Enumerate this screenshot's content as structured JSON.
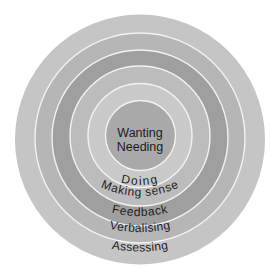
{
  "diagram": {
    "type": "nested-circles",
    "center": {
      "line1": "Wanting",
      "line2": "Needing"
    },
    "rings": [
      {
        "label": "Doing",
        "color": "#c9c9c9"
      },
      {
        "label": "Making sense",
        "color": "#bcbcbc"
      },
      {
        "label": "Feedback",
        "color": "#9f9f9f"
      },
      {
        "label": "Verbalising",
        "color": "#b6b6b6"
      },
      {
        "label": "Assessing",
        "color": "#c5c5c5"
      }
    ],
    "center_color": "#a9a9a9",
    "separator_color": "#f2f2f2"
  }
}
